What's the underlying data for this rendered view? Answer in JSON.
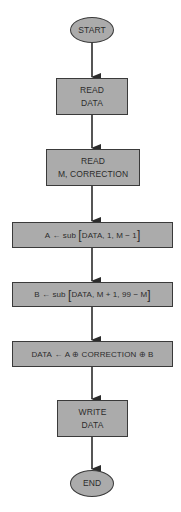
{
  "diagram": {
    "type": "flowchart",
    "colors": {
      "node_fill": "#ababab",
      "border": "#3a3a3a",
      "text": "#2b2b2b",
      "arrow": "#2b2b2b",
      "background": "#ffffff"
    },
    "nodes": [
      {
        "id": "start",
        "shape": "ellipse",
        "lines": [
          "START"
        ]
      },
      {
        "id": "read-data",
        "shape": "rect",
        "lines": [
          "READ",
          "DATA"
        ]
      },
      {
        "id": "read-m-correction",
        "shape": "rect",
        "lines": [
          "READ",
          "M, CORRECTION"
        ]
      },
      {
        "id": "assign-a",
        "shape": "rect",
        "parts": {
          "lhs": "A",
          "arrow": "←",
          "fn": "sub",
          "open": "[",
          "args": "DATA, 1, M − 1",
          "close": "]"
        }
      },
      {
        "id": "assign-b",
        "shape": "rect",
        "parts": {
          "lhs": "B",
          "arrow": "←",
          "fn": "sub",
          "open": "[",
          "args": "DATA, M + 1, 99 − M",
          "close": "]"
        }
      },
      {
        "id": "assign-data",
        "shape": "rect",
        "parts": {
          "lhs": "DATA",
          "arrow": "←",
          "rhs": "A ⊕ CORRECTION ⊕ B"
        }
      },
      {
        "id": "write-data",
        "shape": "rect",
        "lines": [
          "WRITE",
          "DATA"
        ]
      },
      {
        "id": "end",
        "shape": "ellipse",
        "lines": [
          "END"
        ]
      }
    ],
    "edges": [
      {
        "from": "start",
        "to": "read-data"
      },
      {
        "from": "read-data",
        "to": "read-m-correction"
      },
      {
        "from": "read-m-correction",
        "to": "assign-a"
      },
      {
        "from": "assign-a",
        "to": "assign-b"
      },
      {
        "from": "assign-b",
        "to": "assign-data"
      },
      {
        "from": "assign-data",
        "to": "write-data"
      },
      {
        "from": "write-data",
        "to": "end"
      }
    ]
  }
}
